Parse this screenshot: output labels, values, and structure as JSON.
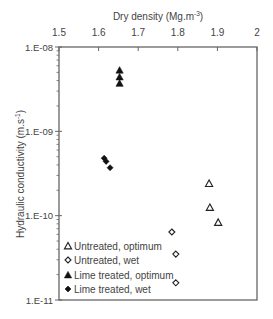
{
  "chart_data": {
    "type": "scatter",
    "title": "",
    "xlabel": "Dry density (Mg.m-3)",
    "xlabel_main": "Dry density (Mg.m",
    "xlabel_sup": "-3",
    "xlabel_close": ")",
    "ylabel": "Hydraulic conductivity (m.s-1)",
    "ylabel_main": "Hydraulic conductivity (m.s",
    "ylabel_sup": "-1",
    "ylabel_close": ")",
    "x_axis_position": "top",
    "xlim": [
      1.5,
      2.0
    ],
    "x_ticks": [
      1.5,
      1.6,
      1.7,
      1.8,
      1.9,
      2.0
    ],
    "x_tick_labels": [
      "1.5",
      "1.6",
      "1.7",
      "1.8",
      "1.9",
      "2"
    ],
    "yscale": "log",
    "ylim": [
      1e-11,
      1e-08
    ],
    "y_ticks": [
      1e-08,
      1e-09,
      1e-10,
      1e-11
    ],
    "y_tick_labels": [
      "1.E-08",
      "1.E-09",
      "1.E-10",
      "1.E-11"
    ],
    "grid": false,
    "legend_position": "lower left, inside",
    "series": [
      {
        "name": "Untreated, optimum",
        "marker": "open-triangle",
        "points": [
          [
            1.879,
            2.4e-10
          ],
          [
            1.881,
            1.25e-10
          ],
          [
            1.902,
            8.3e-11
          ]
        ]
      },
      {
        "name": "Untreated, wet",
        "marker": "open-diamond",
        "points": [
          [
            1.785,
            6.4e-11
          ],
          [
            1.795,
            3.5e-11
          ],
          [
            1.795,
            1.6e-11
          ]
        ]
      },
      {
        "name": "Lime treated, optimum",
        "marker": "filled-triangle",
        "points": [
          [
            1.653,
            5.3e-09
          ],
          [
            1.653,
            4.4e-09
          ],
          [
            1.653,
            3.7e-09
          ]
        ]
      },
      {
        "name": "Lime treated, wet",
        "marker": "filled-diamond",
        "points": [
          [
            1.614,
            4.8e-10
          ],
          [
            1.619,
            4.4e-10
          ],
          [
            1.629,
            3.7e-10
          ]
        ]
      }
    ]
  }
}
